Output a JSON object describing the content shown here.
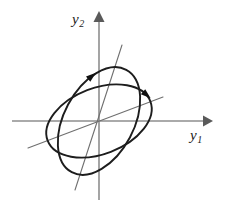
{
  "figure": {
    "title": "",
    "background_color": "#ffffff",
    "width": 225,
    "height": 206,
    "axis_color": "#8e8e8e",
    "curve_color": "#1d1d1d",
    "principal_axis_color": "#6f6f6f"
  },
  "axes": {
    "horizontal": {
      "label": "y",
      "subscript": "1",
      "name": "y1-axis",
      "from_x": 12,
      "to_x": 212,
      "y": 121,
      "arrow": "right"
    },
    "vertical": {
      "label": "y",
      "subscript": "2",
      "name": "y2-axis",
      "from_y": 200,
      "to_y": 12,
      "x": 99,
      "arrow": "up"
    },
    "origin": {
      "x": 99,
      "y": 121
    }
  },
  "chart_data": {
    "type": "line",
    "title": "",
    "xlabel": "y1",
    "ylabel": "y2",
    "grid": false,
    "legend": "none",
    "xlim": [
      -100,
      115
    ],
    "ylim": [
      -80,
      110
    ],
    "series": [
      {
        "name": "ellipse-steep",
        "shape": "ellipse",
        "center": [
          0,
          0
        ],
        "semi_major": 58,
        "semi_minor": 35,
        "rotation_deg": 62,
        "direction": "clockwise",
        "arrow_at_deg": 55
      },
      {
        "name": "ellipse-shallow",
        "shape": "ellipse",
        "center": [
          0,
          0
        ],
        "semi_major": 55,
        "semi_minor": 33,
        "rotation_deg": 21,
        "direction": "clockwise",
        "arrow_at_deg": 18
      }
    ],
    "principal_axes": [
      {
        "name": "principal-axis-steep",
        "from": [
          -24,
          -69
        ],
        "to": [
          23,
          76
        ],
        "slope_deg": 72
      },
      {
        "name": "principal-axis-shallow",
        "from": [
          -71,
          -27
        ],
        "to": [
          64,
          24
        ],
        "slope_deg": 21
      }
    ]
  }
}
